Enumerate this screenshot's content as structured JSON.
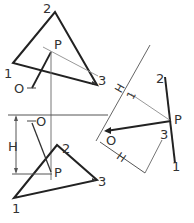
{
  "colors": {
    "background": "#ffffff",
    "heavy_line": "#222222",
    "thin_line": "#888888",
    "label": "#333333"
  },
  "top_view": {
    "vertices": {
      "v1": "1",
      "v2": "2",
      "v3": "3"
    },
    "point_label": "P",
    "observer_label": "O"
  },
  "front_view": {
    "vertices": {
      "v1": "1",
      "v2": "2",
      "v3": "3"
    },
    "point_label": "P",
    "observer_label": "O",
    "dimension_label": "H"
  },
  "auxiliary_view": {
    "edge_labels": {
      "top": "2",
      "bottom": "1",
      "middle": "3"
    },
    "point_label": "P",
    "observer_label": "O",
    "dimension_label_upper": "H",
    "dimension_label_lower": "H",
    "fold_label": "1"
  }
}
